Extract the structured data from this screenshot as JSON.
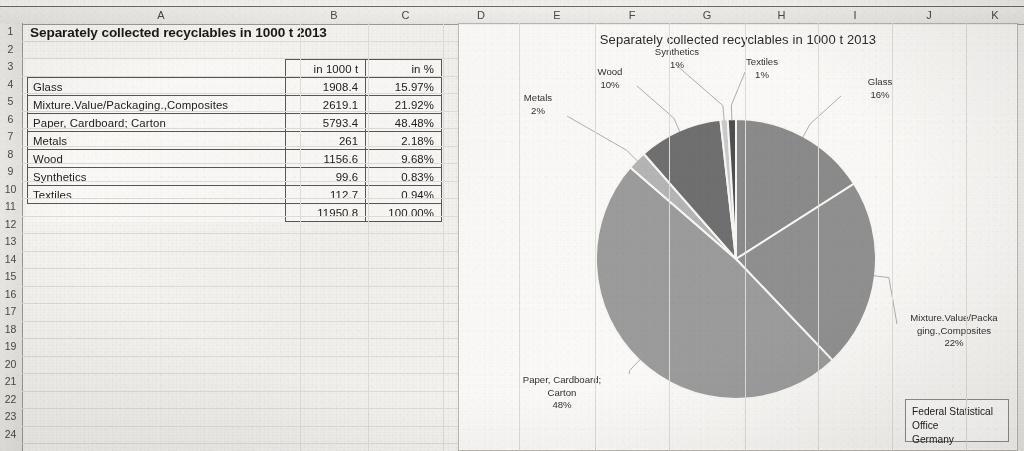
{
  "spreadsheet": {
    "column_headers": [
      "A",
      "B",
      "C",
      "D",
      "E",
      "F",
      "G",
      "H",
      "I",
      "J",
      "K"
    ],
    "row_numbers": [
      "1",
      "2",
      "3",
      "4",
      "5",
      "6",
      "7",
      "8",
      "9",
      "10",
      "11",
      "12",
      "13",
      "14",
      "15",
      "16",
      "17",
      "18",
      "19",
      "20",
      "21",
      "22",
      "23",
      "24"
    ],
    "title_cell": "Separately collected recyclables in 1000 t 2013",
    "table": {
      "headers": [
        "",
        "in 1000 t",
        "in %"
      ],
      "rows": [
        {
          "label": "Glass",
          "amount": "1908.4",
          "percent": "15.97%"
        },
        {
          "label": "Mixture.Value/Packaging.,Composites",
          "amount": "2619.1",
          "percent": "21.92%"
        },
        {
          "label": "Paper, Cardboard; Carton",
          "amount": "5793.4",
          "percent": "48.48%"
        },
        {
          "label": "Metals",
          "amount": "261",
          "percent": "2.18%"
        },
        {
          "label": "Wood",
          "amount": "1156.6",
          "percent": "9.68%"
        },
        {
          "label": "Synthetics",
          "amount": "99.6",
          "percent": "0.83%"
        },
        {
          "label": "Textiles",
          "amount": "112.7",
          "percent": "0.94%"
        }
      ],
      "total": {
        "label": "",
        "amount": "11950.8",
        "percent": "100.00%"
      }
    }
  },
  "chart_data": {
    "type": "pie",
    "title": "Separately collected recyclables in 1000 t 2013",
    "unit": "1000 t",
    "categories": [
      "Glass",
      "Mixture.Value/Packaging.,Composites",
      "Paper, Cardboard; Carton",
      "Metals",
      "Wood",
      "Synthetics",
      "Textiles"
    ],
    "values": [
      1908.4,
      2619.1,
      5793.4,
      261,
      1156.6,
      99.6,
      112.7
    ],
    "percentages": [
      15.97,
      21.92,
      48.48,
      2.18,
      9.68,
      0.83,
      0.94
    ],
    "total": 11950.8,
    "legend": "none",
    "grid": false,
    "data_labels": [
      {
        "name": "Glass",
        "pct_label": "16%",
        "text": "Glass\n16%"
      },
      {
        "name": "Mixture.Value/Packaging.,Composites",
        "pct_label": "22%",
        "text": "Mixture.Value/Packa\nging.,Composites\n22%"
      },
      {
        "name": "Paper, Cardboard; Carton",
        "pct_label": "48%",
        "text": "Paper, Cardboard;\nCarton\n48%"
      },
      {
        "name": "Metals",
        "pct_label": "2%",
        "text": "Metals\n2%"
      },
      {
        "name": "Wood",
        "pct_label": "10%",
        "text": "Wood\n10%"
      },
      {
        "name": "Synthetics",
        "pct_label": "1%",
        "text": "Synthetics\n1%"
      },
      {
        "name": "Textiles",
        "pct_label": "1%",
        "text": "Textiles\n1%"
      }
    ],
    "slice_colors": [
      "#8a8a8a",
      "#8f8f8f",
      "#9b9b9b",
      "#b4b4b4",
      "#6f6f6f",
      "#c9c9c9",
      "#4f4f4f"
    ],
    "credit": "Federal Statistical Office Germany",
    "credit_line1": "Federal Statistical Office",
    "credit_line2": "Germany"
  }
}
